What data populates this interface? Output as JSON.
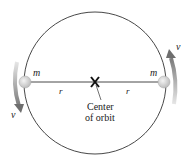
{
  "diagram": {
    "labels": {
      "mass_left": "m",
      "mass_right": "m",
      "radius_left": "r",
      "radius_right": "r",
      "velocity_left": "v",
      "velocity_right": "v",
      "center_line1": "Center",
      "center_line2": "of orbit"
    },
    "colors": {
      "orbit": "#333333",
      "mass": "#d8d8d8",
      "arrow": "#8a8a8a",
      "center_marker": "#111111"
    }
  }
}
